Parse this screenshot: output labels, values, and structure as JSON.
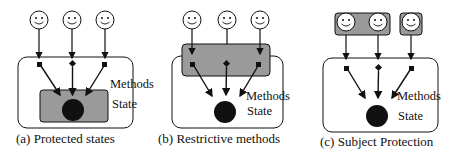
{
  "panels": [
    {
      "id": "a",
      "caption": "(a) Protected states",
      "methods_label": "Methods",
      "state_label": "State",
      "protected_region": "state"
    },
    {
      "id": "b",
      "caption": "(b) Restrictive methods",
      "methods_label": "Methods",
      "state_label": "State",
      "protected_region": "methods"
    },
    {
      "id": "c",
      "caption": "(c) Subject Protection",
      "methods_label": "Methods",
      "state_label": "State",
      "protected_region": "subjects"
    }
  ],
  "icons": {
    "subject": "smiley-face-icon",
    "method": "square-node-icon",
    "state": "filled-circle-icon"
  },
  "colors": {
    "protected_fill": "#9a9a9a",
    "stroke": "#111111",
    "state_fill": "#111111"
  }
}
